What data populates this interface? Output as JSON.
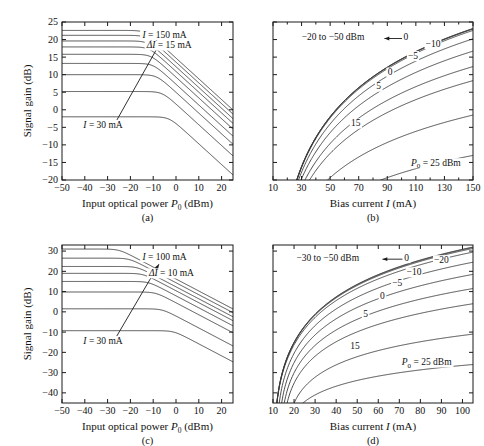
{
  "figure": {
    "caption_a": "(a)",
    "caption_b": "(b)",
    "caption_c": "(c)",
    "caption_d": "(d)",
    "line_color": "#3a3a3a",
    "axis_color": "#1a1a1a",
    "background": "#ffffff"
  },
  "chart_data": [
    {
      "id": "a",
      "type": "line",
      "panel_label": "(a)",
      "title": "",
      "xlabel": "Input optical power P₀ (dBm)",
      "ylabel": "Signal gain (dB)",
      "xlim": [
        -50,
        25
      ],
      "ylim": [
        -20,
        25
      ],
      "xticks": [
        -50,
        -40,
        -30,
        -20,
        -10,
        0,
        10,
        20
      ],
      "xticklabels": [
        "−50",
        "−40",
        "−30",
        "−20",
        "−10",
        "0",
        "10",
        "20"
      ],
      "yticks": [
        -20,
        -15,
        -10,
        -5,
        0,
        5,
        10,
        15,
        20,
        25
      ],
      "yticklabels": [
        "−20",
        "−15",
        "−10",
        "−5",
        "0",
        "5",
        "10",
        "15",
        "20",
        "25"
      ],
      "grid": false,
      "annotations": [
        {
          "text": "I = 150 mA",
          "italic_first": true,
          "x": -5.0,
          "y": 21.0
        },
        {
          "text": "ΔI = 15 mA",
          "italic_first": true,
          "x": -3.0,
          "y": 18.0
        },
        {
          "text": "I = 30 mA",
          "italic_first": true,
          "x": -32.0,
          "y": -4.6
        }
      ],
      "arrow": {
        "x1": -26.0,
        "y1": -3.0,
        "x2": -7.0,
        "y2": 19.0
      },
      "series": [
        {
          "name": "I = 30 mA",
          "current_mA": 30,
          "small_signal_gain_dB": -2.0,
          "p_sat_dBm": -3.0
        },
        {
          "name": "I = 45 mA",
          "current_mA": 45,
          "small_signal_gain_dB": 5.2,
          "p_sat_dBm": -6.0
        },
        {
          "name": "I = 60 mA",
          "current_mA": 60,
          "small_signal_gain_dB": 10.0,
          "p_sat_dBm": -8.5
        },
        {
          "name": "I = 75 mA",
          "current_mA": 75,
          "small_signal_gain_dB": 13.2,
          "p_sat_dBm": -10.0
        },
        {
          "name": "I = 90 mA",
          "current_mA": 90,
          "small_signal_gain_dB": 15.8,
          "p_sat_dBm": -11.0
        },
        {
          "name": "I = 105 mA",
          "current_mA": 105,
          "small_signal_gain_dB": 17.9,
          "p_sat_dBm": -11.8
        },
        {
          "name": "I = 120 mA",
          "current_mA": 120,
          "small_signal_gain_dB": 19.6,
          "p_sat_dBm": -12.4
        },
        {
          "name": "I = 135 mA",
          "current_mA": 135,
          "small_signal_gain_dB": 21.2,
          "p_sat_dBm": -12.9
        },
        {
          "name": "I = 150 mA",
          "current_mA": 150,
          "small_signal_gain_dB": 22.6,
          "p_sat_dBm": -13.3
        }
      ]
    },
    {
      "id": "b",
      "type": "line",
      "panel_label": "(b)",
      "title": "",
      "xlabel": "Bias current I (mA)",
      "ylabel": "",
      "xlim": [
        10,
        150
      ],
      "ylim": [
        -20,
        25
      ],
      "xticks": [
        10,
        30,
        50,
        70,
        90,
        110,
        130,
        150
      ],
      "xticklabels": [
        "10",
        "30",
        "50",
        "70",
        "90",
        "110",
        "130",
        "150"
      ],
      "xminorticks": [
        20,
        40,
        60,
        80,
        100,
        120,
        140
      ],
      "yticks": [
        -20,
        -15,
        -10,
        -5,
        0,
        5,
        10,
        15,
        20,
        25
      ],
      "yticklabels": [],
      "grid": false,
      "annotations": [
        {
          "text": "−20 to −50 dBm",
          "x": 52.0,
          "y": 20.3
        },
        {
          "text": "0",
          "x": 103.0,
          "y": 20.3
        },
        {
          "text": "−10",
          "x": 122.0,
          "y": 18.4
        },
        {
          "text": "−5",
          "x": 108.0,
          "y": 15.0
        },
        {
          "text": "0",
          "x": 92.0,
          "y": 10.3
        },
        {
          "text": "5",
          "x": 84.0,
          "y": 6.3
        },
        {
          "text": "15",
          "x": 68.0,
          "y": -4.2
        },
        {
          "text": "P₀ = 25 dBm",
          "x": 124.0,
          "y": -15.5
        }
      ],
      "arrow": {
        "x1": 101.0,
        "y1": 20.3,
        "x2": 88.0,
        "y2": 20.3
      },
      "series": [
        {
          "name": "P0 = 25 dBm",
          "p0_dBm": 25,
          "g_max_dB": -13.0,
          "i_th_mA": 14
        },
        {
          "name": "P0 = 15 dBm",
          "p0_dBm": 15,
          "g_max_dB": -1.5,
          "i_th_mA": 14
        },
        {
          "name": "P0 = 5 dBm",
          "p0_dBm": 5,
          "g_max_dB": 8.3,
          "i_th_mA": 14
        },
        {
          "name": "P0 = 0 dBm",
          "p0_dBm": 0,
          "g_max_dB": 12.3,
          "i_th_mA": 14
        },
        {
          "name": "P0 = -5 dBm",
          "p0_dBm": -5,
          "g_max_dB": 16.7,
          "i_th_mA": 14
        },
        {
          "name": "P0 = -10 dBm",
          "p0_dBm": -10,
          "g_max_dB": 20.2,
          "i_th_mA": 14
        },
        {
          "name": "P0 = -20 dBm",
          "p0_dBm": -20,
          "g_max_dB": 22.6,
          "i_th_mA": 14
        },
        {
          "name": "P0 = -30 dBm",
          "p0_dBm": -30,
          "g_max_dB": 23.0,
          "i_th_mA": 14
        },
        {
          "name": "P0 = -40 dBm",
          "p0_dBm": -40,
          "g_max_dB": 23.1,
          "i_th_mA": 14
        },
        {
          "name": "P0 = -50 dBm",
          "p0_dBm": -50,
          "g_max_dB": 23.15,
          "i_th_mA": 14
        }
      ]
    },
    {
      "id": "c",
      "type": "line",
      "panel_label": "(c)",
      "title": "",
      "xlabel": "Input optical power P₀ (dBm)",
      "ylabel": "Signal gain (dB)",
      "xlim": [
        -50,
        25
      ],
      "ylim": [
        -45,
        33
      ],
      "xticks": [
        -50,
        -40,
        -30,
        -20,
        -10,
        0,
        10,
        20
      ],
      "xticklabels": [
        "−50",
        "−40",
        "−30",
        "−20",
        "−10",
        "0",
        "10",
        "20"
      ],
      "yticks": [
        -40,
        -30,
        -20,
        -10,
        0,
        10,
        20,
        30
      ],
      "yticklabels": [
        "−40",
        "−30",
        "−20",
        "−10",
        "0",
        "10",
        "20",
        "30"
      ],
      "grid": false,
      "annotations": [
        {
          "text": "I = 100 mA",
          "italic_first": true,
          "x": -5.0,
          "y": 26.5
        },
        {
          "text": "ΔI = 10 mA",
          "italic_first": true,
          "x": -2.0,
          "y": 18.5
        },
        {
          "text": "I = 30 mA",
          "italic_first": true,
          "x": -32.0,
          "y": -15.0
        }
      ],
      "arrow": {
        "x1": -26.0,
        "y1": -12.0,
        "x2": -7.5,
        "y2": 23.5
      },
      "series": [
        {
          "name": "I = 30 mA",
          "current_mA": 30,
          "small_signal_gain_dB": -9.3,
          "p_sat_dBm": -1.0
        },
        {
          "name": "I = 40 mA",
          "current_mA": 40,
          "small_signal_gain_dB": 1.5,
          "p_sat_dBm": -6.0
        },
        {
          "name": "I = 50 mA",
          "current_mA": 50,
          "small_signal_gain_dB": 9.8,
          "p_sat_dBm": -9.0
        },
        {
          "name": "I = 60 mA",
          "current_mA": 60,
          "small_signal_gain_dB": 15.0,
          "p_sat_dBm": -12.0
        },
        {
          "name": "I = 70 mA",
          "current_mA": 70,
          "small_signal_gain_dB": 19.0,
          "p_sat_dBm": -14.5
        },
        {
          "name": "I = 80 mA",
          "current_mA": 80,
          "small_signal_gain_dB": 22.4,
          "p_sat_dBm": -17.0
        },
        {
          "name": "I = 90 mA",
          "current_mA": 90,
          "small_signal_gain_dB": 26.5,
          "p_sat_dBm": -20.5
        },
        {
          "name": "I = 100 mA",
          "current_mA": 100,
          "small_signal_gain_dB": 31.0,
          "p_sat_dBm": -25.0
        }
      ]
    },
    {
      "id": "d",
      "type": "line",
      "panel_label": "(d)",
      "title": "",
      "xlabel": "Bias current I (mA)",
      "ylabel": "",
      "xlim": [
        10,
        105
      ],
      "ylim": [
        -45,
        33
      ],
      "xticks": [
        10,
        20,
        30,
        40,
        50,
        60,
        70,
        80,
        90,
        100
      ],
      "xticklabels": [
        "10",
        "20",
        "30",
        "40",
        "50",
        "60",
        "70",
        "80",
        "90",
        "100"
      ],
      "yticks": [
        -40,
        -30,
        -20,
        -10,
        0,
        10,
        20,
        30
      ],
      "yticklabels": [],
      "grid": false,
      "annotations": [
        {
          "text": "−30 to −50 dBm",
          "x": 36.0,
          "y": 26.0
        },
        {
          "text": "0",
          "x": 73.5,
          "y": 26.0
        },
        {
          "text": "−20",
          "x": 90.0,
          "y": 25.0
        },
        {
          "text": "−10",
          "x": 77.0,
          "y": 19.0
        },
        {
          "text": "−5",
          "x": 69.0,
          "y": 13.5
        },
        {
          "text": "0",
          "x": 62.0,
          "y": 7.0
        },
        {
          "text": "5",
          "x": 54.0,
          "y": -1.5
        },
        {
          "text": "15",
          "x": 49.0,
          "y": -17.5
        },
        {
          "text": "P₀ = 25 dBm",
          "x": 83.0,
          "y": -25.5
        }
      ],
      "arrow": {
        "x1": 71.5,
        "y1": 26.0,
        "x2": 62.0,
        "y2": 26.0
      },
      "series": [
        {
          "name": "P0 = 25 dBm",
          "p0_dBm": 25,
          "g_max_dB": -26.0,
          "i_th_mA": 17
        },
        {
          "name": "P0 = 15 dBm",
          "p0_dBm": 15,
          "g_max_dB": -11.0,
          "i_th_mA": 17
        },
        {
          "name": "P0 = 5 dBm",
          "p0_dBm": 5,
          "g_max_dB": 4.0,
          "i_th_mA": 15
        },
        {
          "name": "P0 = 0 dBm",
          "p0_dBm": 0,
          "g_max_dB": 11.5,
          "i_th_mA": 14
        },
        {
          "name": "P0 = -5 dBm",
          "p0_dBm": -5,
          "g_max_dB": 18.5,
          "i_th_mA": 13
        },
        {
          "name": "P0 = -10 dBm",
          "p0_dBm": -10,
          "g_max_dB": 24.5,
          "i_th_mA": 12
        },
        {
          "name": "P0 = -20 dBm",
          "p0_dBm": -20,
          "g_max_dB": 29.5,
          "i_th_mA": 11
        },
        {
          "name": "P0 = -30 dBm",
          "p0_dBm": -30,
          "g_max_dB": 31.3,
          "i_th_mA": 11
        },
        {
          "name": "P0 = -40 dBm",
          "p0_dBm": -40,
          "g_max_dB": 31.8,
          "i_th_mA": 11
        },
        {
          "name": "P0 = -50 dBm",
          "p0_dBm": -50,
          "g_max_dB": 32.0,
          "i_th_mA": 11
        }
      ]
    }
  ]
}
